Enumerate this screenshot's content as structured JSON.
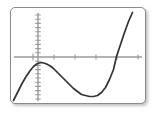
{
  "window": {
    "kind": "graphing-calculator-screen",
    "background_color": "#ffffff",
    "frame_color": "#8a8a8a",
    "frame_rect": {
      "x": 10,
      "y": 7,
      "width": 136,
      "height": 97
    }
  },
  "chart_data": {
    "type": "line",
    "title": "",
    "subtitle": "",
    "xlabel": "",
    "ylabel": "",
    "curve_color": "#333333",
    "axis_color": "#9a9a9a",
    "grid": false,
    "legend": null,
    "legend_position": "none",
    "tick_labels_shown": false,
    "axes": {
      "x_axis_pixel_y": 57,
      "y_axis_pixel_x": 37,
      "x_axis_extent_px": [
        14,
        142
      ],
      "y_axis_extent_px": [
        13,
        101
      ],
      "x_tick_spacing_px": 21,
      "y_tick_spacing_px": 4.2,
      "x_tick_pixels": [
        32,
        53,
        74,
        95,
        116,
        137
      ],
      "x_major_tick_pixels": [
        37
      ]
    },
    "xlim": [
      -2.0,
      5.0
    ],
    "ylim": [
      -6.0,
      6.0
    ],
    "features": {
      "local_maximum_px": {
        "x": 40,
        "y": 64
      },
      "local_minimum_px": {
        "x": 95,
        "y": 97
      },
      "x_intercept_right_px": {
        "x": 117,
        "y": 57
      },
      "entry_point_px": {
        "x": 14,
        "y": 101
      },
      "exit_point_px": {
        "x": 133,
        "y": 13
      }
    },
    "series": [
      {
        "name": "cubic",
        "points_px": [
          [
            14,
            101
          ],
          [
            18,
            93
          ],
          [
            22,
            85
          ],
          [
            26,
            78
          ],
          [
            30,
            72
          ],
          [
            34,
            67
          ],
          [
            38,
            64
          ],
          [
            42,
            63
          ],
          [
            46,
            64
          ],
          [
            50,
            66
          ],
          [
            54,
            69
          ],
          [
            58,
            73
          ],
          [
            62,
            77
          ],
          [
            66,
            81
          ],
          [
            70,
            85
          ],
          [
            74,
            89
          ],
          [
            78,
            92
          ],
          [
            82,
            95
          ],
          [
            86,
            96
          ],
          [
            90,
            97
          ],
          [
            94,
            97
          ],
          [
            98,
            96
          ],
          [
            102,
            93
          ],
          [
            106,
            88
          ],
          [
            110,
            80
          ],
          [
            114,
            70
          ],
          [
            117,
            57
          ],
          [
            121,
            45
          ],
          [
            125,
            33
          ],
          [
            129,
            22
          ],
          [
            133,
            13
          ]
        ]
      }
    ]
  }
}
